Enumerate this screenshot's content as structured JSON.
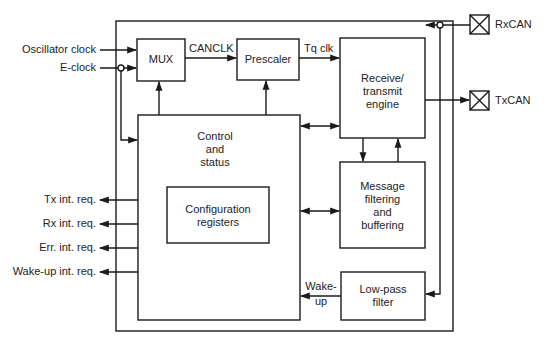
{
  "diagram": {
    "type": "block-diagram",
    "inputs": {
      "oscillator_clock": "Oscillator clock",
      "e_clock": "E-clock"
    },
    "blocks": {
      "mux": "MUX",
      "prescaler": "Prescaler",
      "rx_tx_engine": [
        "Receive/",
        "transmit",
        "engine"
      ],
      "control_status": [
        "Control",
        "and",
        "status"
      ],
      "config_registers": [
        "Configuration",
        "registers"
      ],
      "message_filtering": [
        "Message",
        "filtering",
        "and",
        "buffering"
      ],
      "low_pass_filter": [
        "Low-pass",
        "filter"
      ]
    },
    "signals": {
      "canclk": "CANCLK",
      "tq_clk": "Tq clk",
      "wake_up": [
        "Wake-",
        "up"
      ]
    },
    "pins": {
      "rxcan": "RxCAN",
      "txcan": "TxCAN"
    },
    "interrupt_outputs": [
      "Tx int. req.",
      "Rx int. req.",
      "Err. int. req.",
      "Wake-up int. req."
    ],
    "colors": {
      "line": "#1a1a1a",
      "background": "#ffffff"
    }
  }
}
